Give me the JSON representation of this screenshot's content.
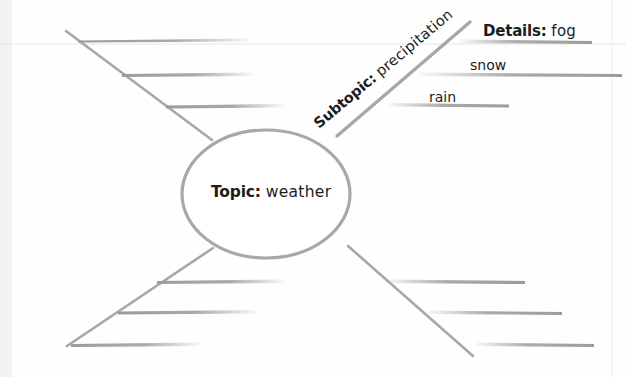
{
  "document": {
    "title": "Concept web graphic organizer",
    "background_color": "#fefefe",
    "line_color": "#9b9b9b",
    "faint_rule_color": "#e8e8e8",
    "text_color": "#1d1d1d"
  },
  "center": {
    "node_name": "topic-node",
    "prefix": "Topic:",
    "value": "weather",
    "shape": "ellipse"
  },
  "branches": [
    {
      "name": "branch-top-left",
      "direction": "top-left",
      "label": "",
      "details": [
        "",
        "",
        ""
      ]
    },
    {
      "name": "branch-top-right",
      "direction": "top-right",
      "prefix": "Subtopic:",
      "label": "precipitation",
      "details_prefix": "Details:",
      "details": [
        "fog",
        "snow",
        "rain"
      ]
    },
    {
      "name": "branch-bottom-left",
      "direction": "bottom-left",
      "label": "",
      "details": [
        "",
        "",
        ""
      ]
    },
    {
      "name": "branch-bottom-right",
      "direction": "bottom-right",
      "label": "",
      "details": [
        "",
        "",
        ""
      ]
    }
  ],
  "labels": {
    "topic_prefix": "Topic:",
    "topic_value": "weather",
    "subtopic_prefix": "Subtopic:",
    "subtopic_value": "precipitation",
    "details_prefix": "Details:",
    "detail_fog": "fog",
    "detail_snow": "snow",
    "detail_rain": "rain"
  }
}
